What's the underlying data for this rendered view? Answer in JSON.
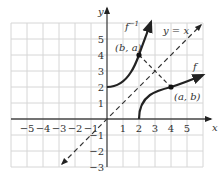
{
  "figure": {
    "title": "",
    "axes": {
      "x_label": "x",
      "y_label": "y",
      "x_ticks": [
        "−5",
        "−4",
        "−3",
        "−2",
        "−1",
        "1",
        "2",
        "3",
        "4",
        "5"
      ],
      "y_ticks": [
        "5",
        "4",
        "3",
        "2",
        "1",
        "−1",
        "−2",
        "−3"
      ],
      "x_range": [
        -6,
        6
      ],
      "y_range": [
        -3,
        6
      ],
      "grid": true
    },
    "curves": {
      "f": {
        "label": "f",
        "color": "#222222"
      },
      "f_inverse": {
        "label": "f",
        "superscript": "−1",
        "color": "#222222"
      },
      "identity": {
        "label": "y = x",
        "style": "dashed"
      }
    },
    "points": {
      "ba": {
        "label": "(b, a)",
        "x": 2,
        "y": 4
      },
      "ab": {
        "label": "(a, b)",
        "x": 4,
        "y": 2
      }
    },
    "colors": {
      "grid": "#d6d6d6",
      "axis": "#444444",
      "curve": "#222222"
    }
  }
}
